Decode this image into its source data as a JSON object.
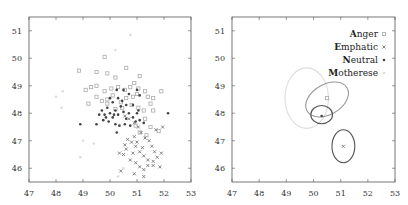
{
  "chart_data": [
    {
      "type": "scatter",
      "title": "",
      "xlabel": "",
      "ylabel": "",
      "xlim": [
        47,
        53
      ],
      "ylim": [
        45.5,
        51.5
      ],
      "xticks": [
        47,
        48,
        49,
        50,
        51,
        52,
        53
      ],
      "yticks": [
        46,
        47,
        48,
        49,
        50,
        51
      ],
      "grid": false,
      "series": [
        {
          "name": "Anger",
          "color": "#aaaaaa",
          "marker": "square-open",
          "points": [
            [
              49.8,
              50.05
            ],
            [
              50.6,
              49.65
            ],
            [
              48.85,
              49.55
            ],
            [
              49.5,
              49.5
            ],
            [
              49.9,
              49.45
            ],
            [
              50.2,
              49.3
            ],
            [
              51.1,
              49.35
            ],
            [
              49.1,
              48.85
            ],
            [
              49.3,
              48.95
            ],
            [
              49.5,
              49.0
            ],
            [
              49.8,
              48.8
            ],
            [
              50.05,
              48.9
            ],
            [
              50.3,
              48.95
            ],
            [
              50.55,
              48.85
            ],
            [
              50.75,
              48.95
            ],
            [
              50.9,
              49.1
            ],
            [
              51.05,
              48.9
            ],
            [
              51.3,
              48.8
            ],
            [
              51.9,
              48.8
            ],
            [
              49.2,
              48.35
            ],
            [
              49.5,
              48.6
            ],
            [
              49.7,
              48.45
            ],
            [
              49.9,
              48.5
            ],
            [
              50.1,
              48.65
            ],
            [
              50.4,
              48.4
            ],
            [
              50.6,
              48.55
            ],
            [
              50.85,
              48.6
            ],
            [
              51.0,
              48.7
            ],
            [
              51.4,
              48.6
            ],
            [
              51.6,
              48.55
            ],
            [
              51.5,
              48.35
            ],
            [
              51.25,
              48.1
            ],
            [
              51.6,
              48.1
            ],
            [
              51.05,
              48.2
            ],
            [
              50.8,
              48.3
            ],
            [
              50.45,
              48.2
            ],
            [
              50.2,
              48.15
            ],
            [
              49.9,
              48.35
            ],
            [
              51.3,
              47.8
            ],
            [
              51.5,
              47.5
            ],
            [
              51.1,
              47.3
            ],
            [
              51.35,
              47.2
            ],
            [
              51.8,
              47.35
            ],
            [
              50.95,
              47.55
            ]
          ]
        },
        {
          "name": "Emphatic",
          "color": "#777777",
          "marker": "x",
          "points": [
            [
              50.55,
              47.9
            ],
            [
              50.7,
              47.8
            ],
            [
              50.9,
              47.65
            ],
            [
              51.05,
              47.5
            ],
            [
              51.15,
              47.3
            ],
            [
              51.3,
              47.1
            ],
            [
              51.45,
              47.0
            ],
            [
              51.55,
              46.8
            ],
            [
              51.65,
              46.6
            ],
            [
              50.8,
              46.95
            ],
            [
              50.95,
              46.8
            ],
            [
              51.1,
              46.6
            ],
            [
              51.25,
              46.45
            ],
            [
              51.4,
              46.3
            ],
            [
              51.6,
              46.25
            ],
            [
              51.75,
              46.4
            ],
            [
              51.9,
              46.55
            ],
            [
              50.6,
              46.7
            ],
            [
              50.5,
              46.5
            ],
            [
              50.75,
              46.3
            ],
            [
              50.95,
              46.2
            ],
            [
              51.1,
              46.05
            ],
            [
              51.25,
              45.95
            ],
            [
              51.4,
              46.1
            ],
            [
              51.6,
              46.1
            ],
            [
              51.85,
              46.05
            ],
            [
              50.4,
              45.9
            ],
            [
              50.9,
              45.8
            ],
            [
              51.25,
              45.7
            ],
            [
              50.35,
              46.55
            ],
            [
              50.55,
              46.85
            ],
            [
              50.65,
              47.05
            ],
            [
              50.9,
              47.15
            ],
            [
              51.0,
              46.95
            ],
            [
              51.2,
              46.75
            ],
            [
              51.95,
              47.5
            ],
            [
              51.7,
              47.4
            ],
            [
              50.85,
              46.55
            ]
          ]
        },
        {
          "name": "Neutral",
          "color": "#444444",
          "marker": "dot",
          "points": [
            [
              48.9,
              47.6
            ],
            [
              49.5,
              47.6
            ],
            [
              49.6,
              47.95
            ],
            [
              49.7,
              48.1
            ],
            [
              49.8,
              47.95
            ],
            [
              49.9,
              48.2
            ],
            [
              50.0,
              48.0
            ],
            [
              50.1,
              47.85
            ],
            [
              50.2,
              48.1
            ],
            [
              50.3,
              47.95
            ],
            [
              50.4,
              48.25
            ],
            [
              50.5,
              48.05
            ],
            [
              50.6,
              47.8
            ],
            [
              50.7,
              48.0
            ],
            [
              50.85,
              47.85
            ],
            [
              51.0,
              48.0
            ],
            [
              51.1,
              47.75
            ],
            [
              50.2,
              47.6
            ],
            [
              50.35,
              47.55
            ],
            [
              50.55,
              47.6
            ],
            [
              50.75,
              47.55
            ],
            [
              50.95,
              47.7
            ],
            [
              49.95,
              47.7
            ],
            [
              49.75,
              47.75
            ],
            [
              50.1,
              48.4
            ],
            [
              50.3,
              48.55
            ],
            [
              50.5,
              48.85
            ],
            [
              50.7,
              48.7
            ],
            [
              50.45,
              48.45
            ],
            [
              50.0,
              48.55
            ],
            [
              50.25,
              48.85
            ],
            [
              51.1,
              48.65
            ],
            [
              50.85,
              48.3
            ],
            [
              51.05,
              48.1
            ],
            [
              52.15,
              48.0
            ],
            [
              51.25,
              47.65
            ],
            [
              50.25,
              47.3
            ],
            [
              50.15,
              47.95
            ],
            [
              49.85,
              47.85
            ],
            [
              50.6,
              48.3
            ],
            [
              51.0,
              48.85
            ]
          ]
        },
        {
          "name": "Motherese",
          "color": "#dddddd",
          "marker": "dot",
          "points": [
            [
              50.75,
              50.85
            ],
            [
              50.2,
              50.3
            ],
            [
              48.25,
              48.8
            ],
            [
              48.0,
              48.6
            ],
            [
              48.2,
              48.2
            ],
            [
              49.0,
              47.0
            ],
            [
              48.9,
              46.4
            ],
            [
              50.5,
              46.0
            ],
            [
              49.4,
              46.9
            ],
            [
              50.3,
              45.7
            ]
          ]
        }
      ]
    },
    {
      "type": "scatter",
      "title": "",
      "xlabel": "",
      "ylabel": "",
      "xlim": [
        47,
        53
      ],
      "ylim": [
        45.5,
        51.5
      ],
      "xticks": [
        47,
        48,
        49,
        50,
        51,
        52,
        53
      ],
      "yticks": [
        46,
        47,
        48,
        49,
        50,
        51
      ],
      "grid": false,
      "legend_position": "upper right",
      "legend": [
        {
          "label": "Anger",
          "initial": "A",
          "rest": "nger",
          "color": "#aaaaaa",
          "marker": "square-open"
        },
        {
          "label": "Emphatic",
          "initial": "E",
          "rest": "mphatic",
          "color": "#777777",
          "marker": "x"
        },
        {
          "label": "Neutral",
          "initial": "N",
          "rest": "eutral",
          "color": "#444444",
          "marker": "dot"
        },
        {
          "label": "Motherese",
          "initial": "M",
          "rest": "otherese",
          "color": "#dddddd",
          "marker": "dot"
        }
      ],
      "ellipses": [
        {
          "name": "Motherese",
          "cx": 49.75,
          "cy": 48.55,
          "rx": 0.8,
          "ry": 1.1,
          "rot": 0,
          "color": "#dddddd",
          "center_marker": false
        },
        {
          "name": "Anger",
          "cx": 50.5,
          "cy": 48.5,
          "rx": 0.85,
          "ry": 0.55,
          "rot": -30,
          "color": "#999999",
          "center": [
            50.5,
            48.55
          ]
        },
        {
          "name": "Neutral",
          "cx": 50.3,
          "cy": 47.95,
          "rx": 0.4,
          "ry": 0.33,
          "rot": 0,
          "color": "#555555",
          "center": [
            50.3,
            47.9
          ]
        },
        {
          "name": "Emphatic",
          "cx": 51.1,
          "cy": 46.8,
          "rx": 0.42,
          "ry": 0.6,
          "rot": 0,
          "color": "#555555",
          "center": [
            51.1,
            46.8
          ]
        }
      ]
    }
  ]
}
